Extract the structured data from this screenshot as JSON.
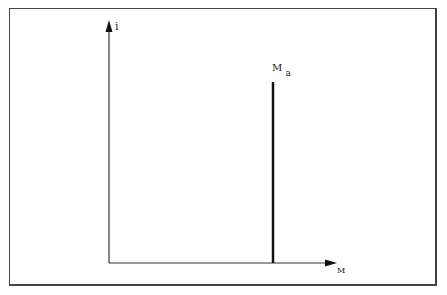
{
  "diagram": {
    "y_axis_label": "i",
    "x_axis_label": "M",
    "marker_label_main": "M",
    "marker_label_sub": "a",
    "colors": {
      "line": "#111111",
      "frame": "#444444"
    }
  }
}
